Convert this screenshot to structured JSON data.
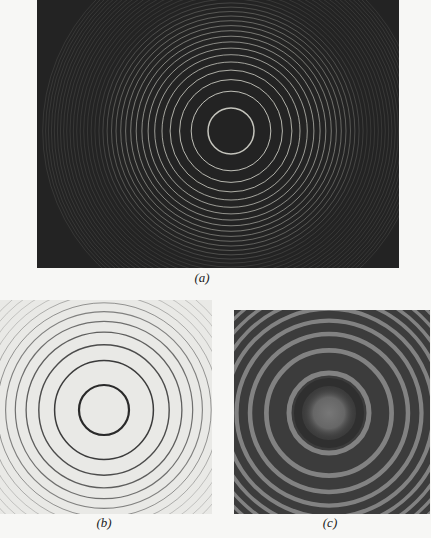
{
  "figure": {
    "panels": [
      {
        "id": "a",
        "label": "(a)",
        "description": "Bright circular interference fringes on dark background",
        "background": "#232323",
        "ring_color": "#cfcfc6",
        "bounds": {
          "x": 37,
          "y": 0,
          "w": 362,
          "h": 268
        },
        "center": {
          "x": 194,
          "y": 131
        },
        "first_radius": 23,
        "ring_count": 34,
        "caption_pos": {
          "x": 202,
          "y": 270
        }
      },
      {
        "id": "b",
        "label": "(b)",
        "description": "Dark circular fringe contours on light background",
        "background": "#e9e9e6",
        "ring_color": "#2a2a2a",
        "bounds": {
          "x": 0,
          "y": 300,
          "w": 212,
          "h": 214
        },
        "center": {
          "x": 104,
          "y": 110
        },
        "first_radius": 25,
        "ring_count": 12,
        "caption_pos": {
          "x": 104,
          "y": 515
        }
      },
      {
        "id": "c",
        "label": "(c)",
        "description": "Photographic interference ring pattern",
        "background": "#3c3c3c",
        "ring_color": "#8e8e8e",
        "bounds": {
          "x": 234,
          "y": 310,
          "w": 196,
          "h": 204
        },
        "center": {
          "x": 95,
          "y": 103
        },
        "first_radius": 40,
        "ring_count": 16,
        "caption_pos": {
          "x": 330,
          "y": 515
        }
      }
    ]
  }
}
